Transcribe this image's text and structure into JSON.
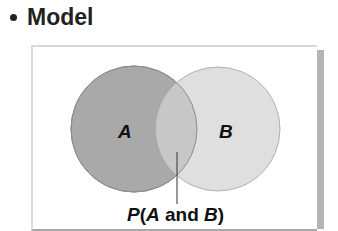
{
  "heading": {
    "text": "Model"
  },
  "diagram": {
    "set_a_label": "A",
    "set_b_label": "B",
    "intersection_label_prefix": "P(",
    "intersection_label_a": "A",
    "intersection_label_mid": " and ",
    "intersection_label_b": "B",
    "intersection_label_suffix": ")",
    "colors": {
      "set_a": "#a8a8a8",
      "set_b": "#dedede",
      "overlap": "#c6c6c6",
      "stroke": "#8a8a8a"
    }
  }
}
